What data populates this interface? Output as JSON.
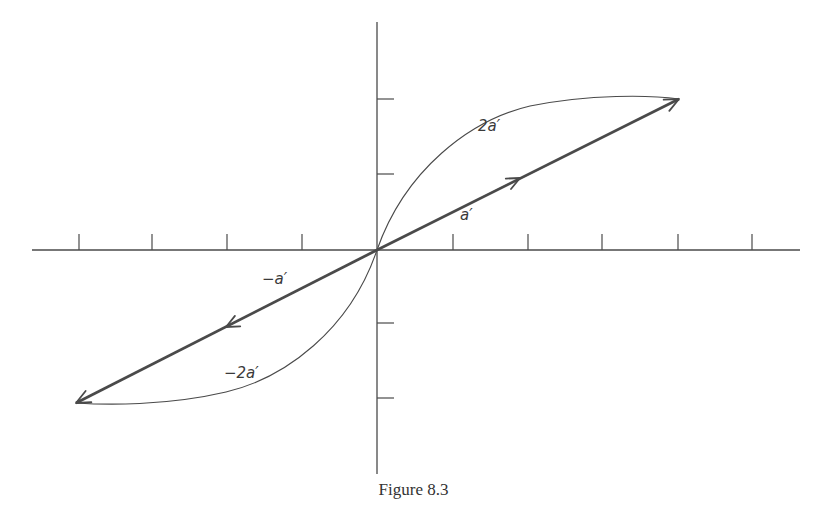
{
  "figure": {
    "caption": "Figure 8.3",
    "colors": {
      "ink": "#4a4a4a",
      "background": "#ffffff"
    },
    "axes": {
      "origin": [
        377,
        250
      ],
      "x_axis": {
        "from": 32,
        "to": 800
      },
      "y_axis": {
        "from": 22,
        "to": 474
      },
      "x_ticks": [
        79,
        152,
        227,
        302,
        453,
        528,
        602,
        678,
        752
      ],
      "y_ticks": [
        99,
        174,
        323,
        398
      ]
    },
    "vectors": [
      {
        "name": "a-prime",
        "label": "a′",
        "from": [
          377,
          250
        ],
        "to": [
          679,
          99
        ],
        "mid_arrow": [
          520,
          178
        ],
        "style": "bold"
      },
      {
        "name": "neg-a-prime",
        "label": "−a′",
        "from": [
          377,
          250
        ],
        "to": [
          76,
          403
        ],
        "mid_arrow": [
          226,
          327
        ],
        "style": "bold"
      }
    ],
    "curves": [
      {
        "name": "two-a-prime",
        "label": "2a′",
        "path": "M377,250 C405,170 470,120 530,106 C590,94 650,95 679,99"
      },
      {
        "name": "neg-two-a-prime",
        "label": "−2a′",
        "path": "M377,250 C350,330 285,378 226,392 C166,406 106,405 76,403"
      }
    ],
    "labels": [
      {
        "name": "label-2a-prime",
        "text": "2a′",
        "x": 478,
        "y": 117
      },
      {
        "name": "label-a-prime",
        "text": "a′",
        "x": 460,
        "y": 206
      },
      {
        "name": "label-neg-a-prime",
        "text": "−a′",
        "x": 262,
        "y": 270
      },
      {
        "name": "label-neg-2a-prime",
        "text": "−2a′",
        "x": 224,
        "y": 364
      }
    ]
  }
}
